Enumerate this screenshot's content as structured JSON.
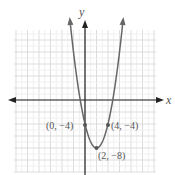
{
  "chart_data": {
    "type": "line",
    "title": "",
    "xlabel": "x",
    "ylabel": "y",
    "function": "y = (x-2)^2 - 8 = x^2 - 4x - 4",
    "xlim": [
      -12,
      12
    ],
    "ylim": [
      -12,
      12
    ],
    "grid": true,
    "points": [
      {
        "x": 0,
        "y": -4,
        "label": "(0, −4)"
      },
      {
        "x": 4,
        "y": -4,
        "label": "(4, −4)"
      },
      {
        "x": 2,
        "y": -8,
        "label": "(2, −8)"
      }
    ]
  },
  "labels": {
    "x_axis": "x",
    "y_axis": "y",
    "p0": "(0, −4)",
    "p1": "(4, −4)",
    "p2": "(2, −8)"
  },
  "colors": {
    "curve": "#666666",
    "axis": "#222222",
    "grid": "#d8d8d8",
    "point": "#555555"
  }
}
